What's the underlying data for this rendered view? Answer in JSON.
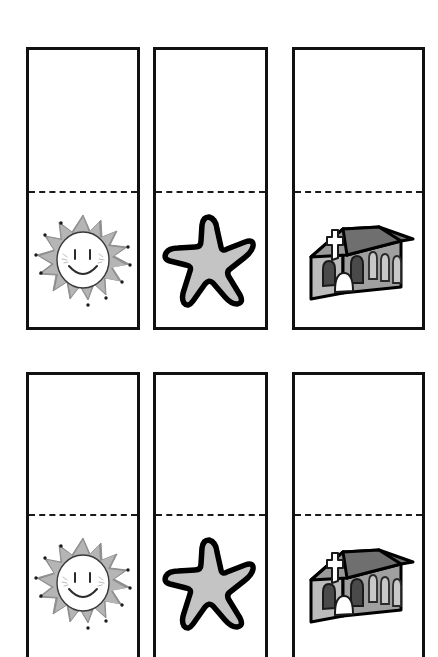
{
  "page": {
    "background_color": "#ffffff",
    "width": 438,
    "height": 643
  },
  "style": {
    "card_border_color": "#111111",
    "fold_line_style": "dashed",
    "fold_line_color": "#1a1a1a",
    "outline_color": "#000000",
    "gray_light": "#c9c9c9",
    "gray_mid": "#a8a8a8",
    "gray_dark": "#808080",
    "gray_darker": "#606060",
    "white": "#ffffff"
  },
  "rows": [
    {
      "row_name": "top-row",
      "cards": [
        {
          "card_name": "sun-card",
          "icon": "sun-icon",
          "icon_label": "Smiling sun",
          "top_half": "blank",
          "bottom_half": "picture"
        },
        {
          "card_name": "star-card",
          "icon": "star-icon",
          "icon_label": "Five point star",
          "top_half": "blank",
          "bottom_half": "picture"
        },
        {
          "card_name": "church-card",
          "icon": "church-icon",
          "icon_label": "Church building with cross",
          "top_half": "blank",
          "bottom_half": "picture"
        }
      ]
    },
    {
      "row_name": "bottom-row",
      "cards": [
        {
          "card_name": "sun-card",
          "icon": "sun-icon",
          "icon_label": "Smiling sun",
          "top_half": "blank",
          "bottom_half": "picture"
        },
        {
          "card_name": "star-card",
          "icon": "star-icon",
          "icon_label": "Five point star",
          "top_half": "blank",
          "bottom_half": "picture"
        },
        {
          "card_name": "church-card",
          "icon": "church-icon",
          "icon_label": "Church building with cross",
          "top_half": "blank",
          "bottom_half": "picture"
        }
      ]
    }
  ]
}
